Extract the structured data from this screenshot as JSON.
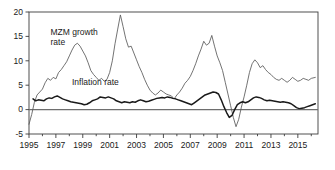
{
  "chart_data": {
    "type": "line",
    "title": "",
    "xlabel": "",
    "ylabel": "",
    "ylim": [
      -5,
      20
    ],
    "xlim": [
      1995.0,
      2016.5
    ],
    "ytick_labels": [
      "20",
      "15",
      "10",
      "5",
      "0",
      "-5"
    ],
    "ytick_values": [
      20,
      15,
      10,
      5,
      0,
      -5
    ],
    "xtick_labels": [
      "1995",
      "1997",
      "1999",
      "2001",
      "2003",
      "2005",
      "2007",
      "2009",
      "2011",
      "2013",
      "2015"
    ],
    "xtick_values": [
      1995,
      1997,
      1999,
      2001,
      2003,
      2005,
      2007,
      2009,
      2011,
      2013,
      2015
    ],
    "xtick_minor_values": [
      1996,
      1998,
      2000,
      2002,
      2004,
      2006,
      2008,
      2010,
      2012,
      2014,
      2016
    ],
    "grid": false,
    "legend_position": "inline-annotations",
    "annotations": [
      {
        "text": "MZM growth",
        "x": 1996.6,
        "y": 15.3
      },
      {
        "text": "rate",
        "x": 1996.6,
        "y": 13.2
      },
      {
        "text": "Inflation rate",
        "x": 1998.2,
        "y": 5.0
      }
    ],
    "series": [
      {
        "name": "MZM growth rate",
        "color": "#5a5a5a",
        "style": "thin",
        "x": [
          1995.0,
          1995.2,
          1995.4,
          1995.6,
          1995.8,
          1996.0,
          1996.2,
          1996.4,
          1996.6,
          1996.8,
          1997.0,
          1997.2,
          1997.4,
          1997.6,
          1997.8,
          1998.0,
          1998.2,
          1998.4,
          1998.6,
          1998.8,
          1999.0,
          1999.2,
          1999.4,
          1999.6,
          1999.8,
          2000.0,
          2000.2,
          2000.4,
          2000.6,
          2000.8,
          2001.0,
          2001.2,
          2001.4,
          2001.6,
          2001.8,
          2002.0,
          2002.2,
          2002.4,
          2002.6,
          2002.8,
          2003.0,
          2003.2,
          2003.4,
          2003.6,
          2003.8,
          2004.0,
          2004.2,
          2004.4,
          2004.6,
          2004.8,
          2005.0,
          2005.2,
          2005.4,
          2005.6,
          2005.8,
          2006.0,
          2006.2,
          2006.4,
          2006.6,
          2006.8,
          2007.0,
          2007.2,
          2007.4,
          2007.6,
          2007.8,
          2008.0,
          2008.2,
          2008.4,
          2008.6,
          2008.8,
          2009.0,
          2009.2,
          2009.4,
          2009.6,
          2009.8,
          2010.0,
          2010.2,
          2010.4,
          2010.6,
          2010.8,
          2011.0,
          2011.2,
          2011.4,
          2011.6,
          2011.8,
          2012.0,
          2012.2,
          2012.4,
          2012.6,
          2012.8,
          2013.0,
          2013.2,
          2013.4,
          2013.6,
          2013.8,
          2014.0,
          2014.2,
          2014.4,
          2014.6,
          2014.8,
          2015.0,
          2015.2,
          2015.4,
          2015.6,
          2015.8,
          2016.0,
          2016.3
        ],
        "y": [
          -3.0,
          -1.0,
          1.5,
          3.0,
          3.6,
          4.2,
          5.5,
          6.4,
          6.0,
          6.6,
          6.3,
          7.6,
          8.2,
          9.0,
          9.8,
          11.0,
          12.2,
          13.2,
          13.6,
          13.0,
          12.0,
          11.0,
          9.6,
          8.0,
          7.2,
          6.6,
          6.0,
          6.4,
          5.8,
          6.2,
          7.6,
          10.0,
          13.5,
          16.5,
          19.4,
          17.0,
          14.5,
          12.8,
          13.0,
          11.6,
          10.2,
          8.8,
          7.6,
          6.2,
          5.0,
          4.0,
          3.4,
          3.0,
          3.4,
          4.0,
          3.6,
          3.2,
          3.0,
          2.8,
          2.2,
          3.0,
          3.6,
          4.4,
          5.4,
          6.0,
          6.8,
          8.0,
          9.4,
          11.0,
          12.4,
          14.0,
          13.2,
          13.6,
          15.2,
          13.0,
          11.0,
          9.6,
          8.0,
          5.6,
          3.2,
          0.8,
          -1.6,
          -3.5,
          -2.0,
          0.5,
          2.6,
          5.0,
          7.6,
          9.4,
          10.2,
          9.6,
          8.6,
          9.0,
          8.2,
          7.6,
          7.2,
          6.6,
          6.2,
          6.0,
          6.4,
          6.0,
          5.6,
          6.0,
          6.6,
          6.2,
          5.8,
          6.0,
          6.4,
          6.2,
          6.0,
          6.4,
          6.6
        ]
      },
      {
        "name": "Inflation rate",
        "color": "#1a1a1a",
        "style": "thick",
        "x": [
          1995.3,
          1995.5,
          1995.7,
          1995.9,
          1996.1,
          1996.3,
          1996.5,
          1996.7,
          1996.9,
          1997.1,
          1997.3,
          1997.5,
          1997.7,
          1997.9,
          1998.1,
          1998.3,
          1998.5,
          1998.7,
          1998.9,
          1999.1,
          1999.3,
          1999.5,
          1999.7,
          1999.9,
          2000.1,
          2000.3,
          2000.5,
          2000.7,
          2000.9,
          2001.1,
          2001.3,
          2001.5,
          2001.7,
          2001.9,
          2002.1,
          2002.3,
          2002.5,
          2002.7,
          2002.9,
          2003.1,
          2003.3,
          2003.5,
          2003.7,
          2003.9,
          2004.1,
          2004.3,
          2004.5,
          2004.7,
          2004.9,
          2005.1,
          2005.3,
          2005.5,
          2005.7,
          2005.9,
          2006.1,
          2006.3,
          2006.5,
          2006.7,
          2006.9,
          2007.1,
          2007.3,
          2007.5,
          2007.7,
          2007.9,
          2008.1,
          2008.3,
          2008.5,
          2008.7,
          2008.9,
          2009.1,
          2009.3,
          2009.5,
          2009.7,
          2009.9,
          2010.1,
          2010.3,
          2010.5,
          2010.7,
          2010.9,
          2011.1,
          2011.3,
          2011.5,
          2011.7,
          2011.9,
          2012.1,
          2012.3,
          2012.5,
          2012.7,
          2012.9,
          2013.1,
          2013.3,
          2013.5,
          2013.7,
          2013.9,
          2014.1,
          2014.3,
          2014.5,
          2014.7,
          2014.9,
          2015.1,
          2015.3,
          2015.5,
          2015.7,
          2015.9,
          2016.1,
          2016.3
        ],
        "y": [
          2.2,
          1.8,
          2.0,
          1.9,
          1.8,
          2.2,
          2.4,
          2.3,
          2.6,
          2.8,
          2.5,
          2.2,
          2.0,
          1.8,
          1.6,
          1.5,
          1.4,
          1.3,
          1.2,
          1.0,
          1.1,
          1.4,
          1.8,
          2.0,
          2.2,
          2.6,
          2.5,
          2.4,
          2.6,
          2.4,
          2.2,
          1.8,
          1.6,
          1.4,
          1.6,
          1.5,
          1.4,
          1.6,
          1.5,
          1.8,
          2.0,
          1.8,
          1.6,
          1.7,
          1.9,
          2.1,
          2.3,
          2.4,
          2.5,
          2.4,
          2.6,
          2.5,
          2.3,
          2.2,
          2.0,
          1.8,
          1.6,
          1.4,
          1.2,
          1.0,
          1.4,
          1.8,
          2.2,
          2.6,
          3.0,
          3.2,
          3.4,
          3.6,
          3.5,
          3.2,
          2.0,
          0.6,
          -0.6,
          -1.6,
          -1.2,
          0.0,
          1.0,
          1.4,
          1.6,
          1.4,
          1.6,
          2.0,
          2.4,
          2.6,
          2.5,
          2.3,
          2.0,
          1.8,
          1.9,
          1.8,
          1.7,
          1.6,
          1.5,
          1.6,
          1.5,
          1.4,
          1.2,
          0.8,
          0.4,
          0.2,
          0.3,
          0.4,
          0.6,
          0.8,
          1.0,
          1.2
        ]
      }
    ]
  }
}
